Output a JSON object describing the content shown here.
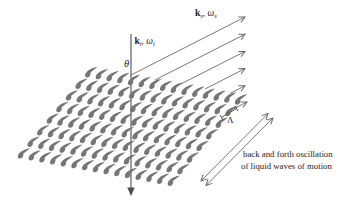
{
  "diagram": {
    "background_color": "#ffffff",
    "line_color": "#5a5a5a",
    "arrow_color": "#6a6a6a",
    "crest_color": "#767676",
    "text_color": "#1e1e1e",
    "incident_label": {
      "vector": "k",
      "vector_sub": "i",
      "comma": ",",
      "omega": "ω",
      "omega_sub": "i"
    },
    "scattered_label": {
      "vector": "k",
      "vector_sub": "s",
      "comma": ",",
      "omega": "ω",
      "omega_sub": "s"
    },
    "angle_label": "θ",
    "wavelength_label": "Λ",
    "caption": {
      "line1": "back and forth oscillation",
      "line2": "of liquid waves of motion"
    },
    "wave_grid": {
      "rows": 8,
      "cols": 15
    },
    "scattered_arrow_count": 6
  }
}
